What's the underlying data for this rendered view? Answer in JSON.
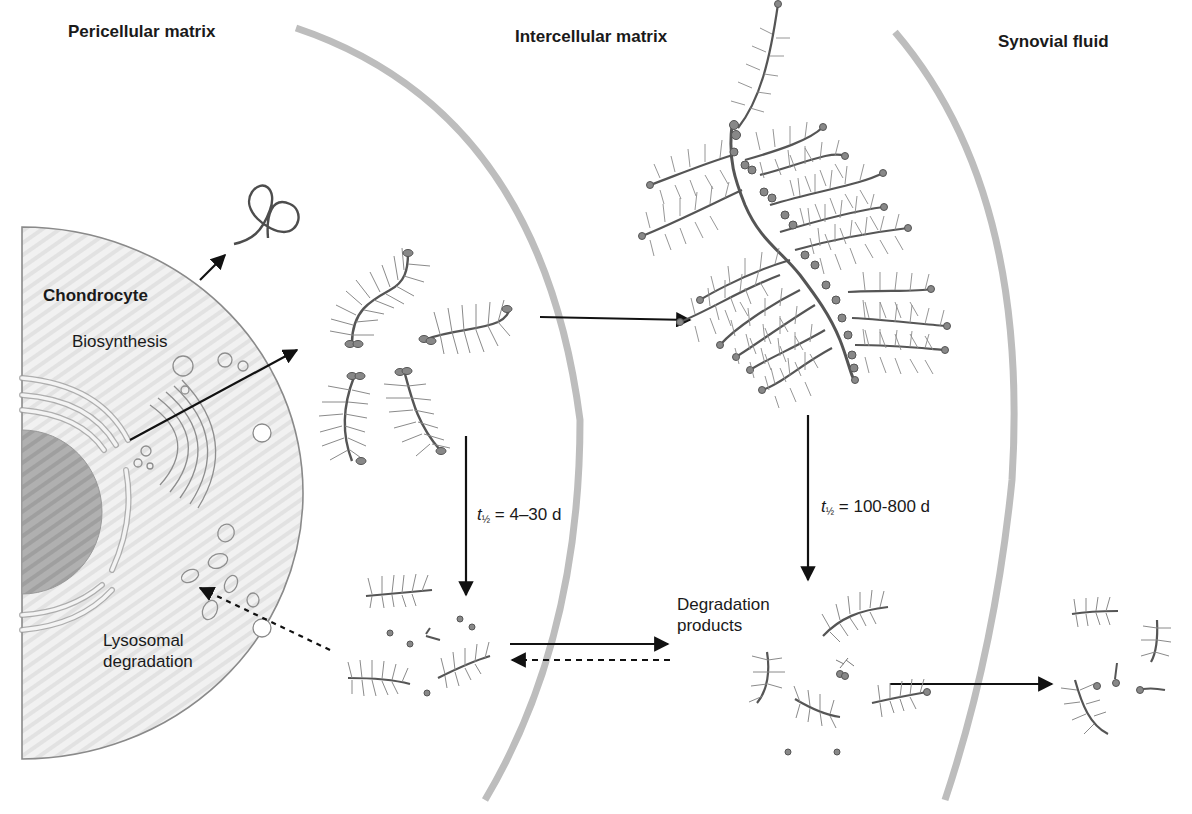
{
  "regions": {
    "pericellular": "Pericellular matrix",
    "intercellular": "Intercellular matrix",
    "synovial": "Synovial fluid"
  },
  "cell": {
    "title": "Chondrocyte",
    "biosynthesis": "Biosynthesis",
    "lysosomal_line1": "Lysosomal",
    "lysosomal_line2": "degradation"
  },
  "halflife": [
    {
      "symbol": "t",
      "sub": "½",
      "value": "= 4–30 d"
    },
    {
      "symbol": "t",
      "sub": "½",
      "value": "= 100-800 d"
    }
  ],
  "degradation": {
    "line1": "Degradation",
    "line2": "products"
  },
  "colors": {
    "boundary": "#b5b5b5",
    "cell_fill": "#efefef",
    "cell_stroke": "#8a8a8a",
    "nucleus": "#a9a9a9",
    "core_protein": "#5a5a5a",
    "gag_chain": "#7d7d7d",
    "arrow": "#111111"
  }
}
